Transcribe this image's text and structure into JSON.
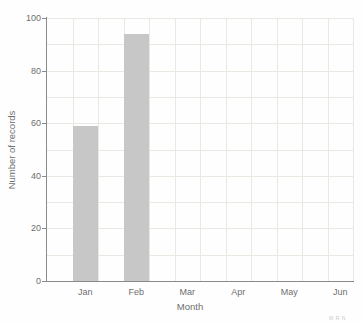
{
  "chart_data": {
    "type": "bar",
    "title": "",
    "categories": [
      "Jan",
      "Feb",
      "Mar",
      "Apr",
      "May",
      "Jun"
    ],
    "values": [
      59,
      94,
      0,
      0,
      0,
      0
    ],
    "xlabel": "Month",
    "ylabel": "Number of records",
    "ylim": [
      0,
      100
    ],
    "yticks": [
      0,
      20,
      40,
      60,
      80,
      100
    ],
    "grid": "on",
    "grid_minor_step_y": 10,
    "grid_vertical": "half-month intervals",
    "legend": "none",
    "colors": {
      "bar": "#c7c7c7",
      "grid": "#e9e9e4",
      "spine": "#8a8a8a",
      "text": "#6e6e6e",
      "corner_mark": "#c9c9c6"
    }
  },
  "figure": {
    "corner_mark": "MRN"
  }
}
